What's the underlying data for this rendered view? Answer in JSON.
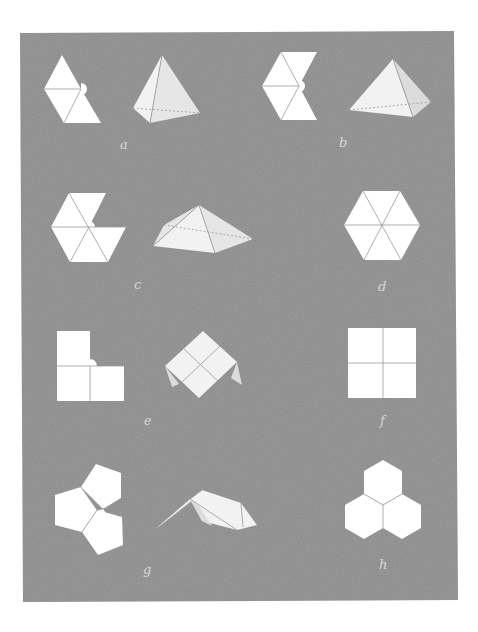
{
  "figure": {
    "background_color": "#8a8a8a",
    "paper_color": "#ffffff",
    "panel_label_color": "#d8d8d8",
    "panels": [
      {
        "id": "a",
        "label": "a",
        "net": "four-triangle net with gap (tetrahedron net)",
        "folded": "tetrahedron"
      },
      {
        "id": "b",
        "label": "b",
        "net": "five-triangle net with gap",
        "folded": "square pyramid"
      },
      {
        "id": "c",
        "label": "c",
        "net": "hexagon missing one triangle",
        "folded": "pentagonal pyramid"
      },
      {
        "id": "d",
        "label": "d",
        "net": "full hexagon of six triangles",
        "folded": ""
      },
      {
        "id": "e",
        "label": "e",
        "net": "three squares (L-shape) with gap",
        "folded": "folded square corner"
      },
      {
        "id": "f",
        "label": "f",
        "net": "four squares (flat square)",
        "folded": ""
      },
      {
        "id": "g",
        "label": "g",
        "net": "three pentagons with gap",
        "folded": "folded pentagon vertex"
      },
      {
        "id": "h",
        "label": "h",
        "net": "three hexagons (flat)",
        "folded": ""
      }
    ]
  }
}
